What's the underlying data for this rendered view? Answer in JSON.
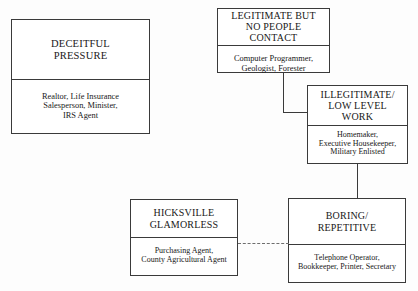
{
  "diagram": {
    "line_color": "#3a3a3a",
    "dashed_line_color": "#6e6e6e",
    "background": "#fdfdfd",
    "nodes": [
      {
        "id": "deceitful",
        "title": "DECEITFUL\nPRESSURE",
        "examples": "Realtor, Life Insurance\nSalesperson, Minister,\nIRS Agent"
      },
      {
        "id": "legitimate",
        "title": "LEGITIMATE BUT\nNO PEOPLE CONTACT",
        "examples": "Computer Programmer,\nGeologist, Forester"
      },
      {
        "id": "illegitimate",
        "title": "ILLEGITIMATE/\nLOW LEVEL\nWORK",
        "examples": "Homemaker,\nExecutive Housekeeper,\nMilitary Enlisted"
      },
      {
        "id": "hicksville",
        "title": "HICKSVILLE\nGLAMORLESS",
        "examples": "Purchasing Agent,\nCounty Agricultural Agent"
      },
      {
        "id": "boring",
        "title": "BORING/\nREPETITIVE",
        "examples": "Telephone Operator,\nBookkeeper, Printer, Secretary"
      }
    ],
    "connectors": [
      {
        "id": "legitimate-to-illegitimate",
        "style": "solid",
        "shape": "elbow"
      },
      {
        "id": "illegitimate-to-boring",
        "style": "solid",
        "shape": "vertical"
      },
      {
        "id": "hicksville-to-boring",
        "style": "dashed",
        "shape": "horizontal"
      }
    ]
  }
}
